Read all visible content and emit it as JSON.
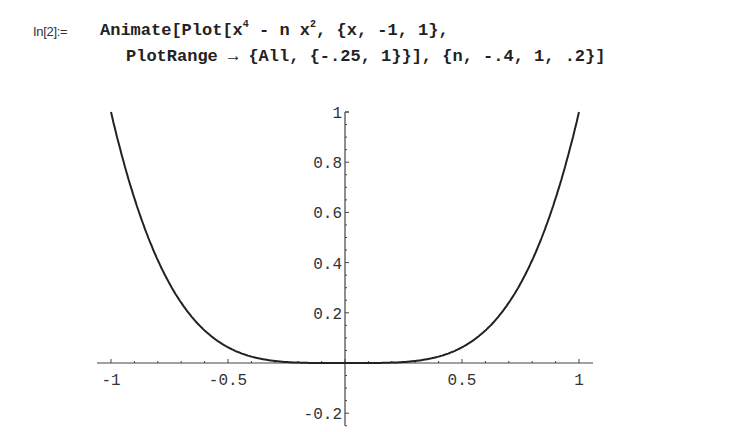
{
  "cell": {
    "prompt": "In[2]:=",
    "line1_prefix": "Animate[Plot[x",
    "line1_exp1": "4",
    "line1_mid": " - n x",
    "line1_exp2": "2",
    "line1_suffix": ", {x, -1, 1},",
    "line2": "PlotRange → {All, {-.25, 1}}], {n, -.4, 1, .2}]"
  },
  "chart_data": {
    "type": "line",
    "title": "",
    "function": "x^4 - n x^2 (frame shown: n = 0)",
    "xlabel": "",
    "ylabel": "",
    "xlim": [
      -1,
      1
    ],
    "ylim": [
      -0.25,
      1
    ],
    "x_ticks": [
      "-1",
      "-0.5",
      "0.5",
      "1"
    ],
    "y_ticks": [
      "-0.2",
      "0.2",
      "0.4",
      "0.6",
      "0.8",
      "1"
    ],
    "grid": false,
    "legend": null,
    "series": [
      {
        "name": "x^4",
        "x": [
          -1,
          -0.9,
          -0.8,
          -0.7,
          -0.6,
          -0.5,
          -0.4,
          -0.3,
          -0.2,
          -0.1,
          0,
          0.1,
          0.2,
          0.3,
          0.4,
          0.5,
          0.6,
          0.7,
          0.8,
          0.9,
          1
        ],
        "y": [
          1,
          0.656,
          0.41,
          0.24,
          0.13,
          0.0625,
          0.0256,
          0.0081,
          0.0016,
          0.0001,
          0,
          0.0001,
          0.0016,
          0.0081,
          0.0256,
          0.0625,
          0.13,
          0.24,
          0.41,
          0.656,
          1
        ]
      }
    ]
  }
}
